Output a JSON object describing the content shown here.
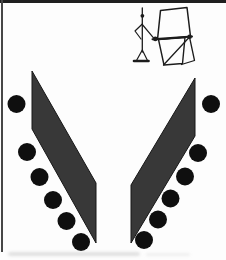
{
  "figure": {
    "kind": "scanned-book-diagram",
    "icon_name": "person-tilting-board-on-stand-icon"
  },
  "canvas": {
    "width": 226,
    "height": 260,
    "background": "#fdfdfd"
  },
  "colors": {
    "top_border": "#1f1f1f",
    "left_border": "#474747",
    "panel_fill": "#383838",
    "panel_stroke": "#161616",
    "dot_fill": "#0f0f0f",
    "icon_stroke": "#1c1c1c",
    "smudge": "#c4c4c4"
  },
  "shapes": {
    "left_panel": {
      "points": "32,71 96,183 96,243 32,129"
    },
    "right_panel": {
      "points": "195,78 195,136 131,243 131,185"
    },
    "dot_radius": 9,
    "left_dots": [
      [
        16.5,
        104
      ],
      [
        27,
        152
      ],
      [
        39.5,
        177
      ],
      [
        53,
        200
      ],
      [
        66.5,
        221
      ],
      [
        81,
        242
      ]
    ],
    "right_dots": [
      [
        211,
        104
      ],
      [
        198,
        153
      ],
      [
        185,
        176.5
      ],
      [
        170.5,
        198.5
      ],
      [
        158,
        219.5
      ],
      [
        144,
        240
      ]
    ]
  },
  "icon": {
    "paths": [
      {
        "part": "figure-body-and-antenna",
        "d": "M142.3 8 L142.3 52",
        "w": 1.3
      },
      {
        "part": "figure-left-arm-akimbo",
        "d": "M142.3 24 L135 31 L141 39",
        "w": 1.2
      },
      {
        "part": "figure-right-arm-to-board",
        "d": "M142.3 24.5 L153.5 37.8",
        "w": 1.2
      },
      {
        "part": "figure-base-legs",
        "d": "M142.3 50 L136.5 60.5 M142.3 50 L147.5 60.5",
        "w": 1.2
      },
      {
        "part": "figure-base-bar",
        "d": "M134 61 L148.5 61",
        "w": 2.6
      },
      {
        "part": "board-upper-panel",
        "d": "M160.5 10.5 L187 7.5 L190.5 36.5 L157.5 39.5 Z",
        "w": 1.5
      },
      {
        "part": "board-pivot-bar",
        "d": "M152.5 39.3 L192 36.6",
        "w": 2
      },
      {
        "part": "board-lower-panel",
        "d": "M158.5 39.5 L185 37.5 L182.5 63.5 L164 65 Z",
        "w": 1.4
      },
      {
        "part": "board-support-legs",
        "d": "M189.5 37 L163.5 65 M189.5 37 L194.5 60.5 L181.5 64.5",
        "w": 1.3
      }
    ],
    "knobs": [
      {
        "part": "figure-head",
        "cx": 142.4,
        "cy": 15.8,
        "r": 1.9
      },
      {
        "part": "board-left-pivot",
        "cx": 155.3,
        "cy": 38.9,
        "r": 2.3
      },
      {
        "part": "board-right-pivot",
        "cx": 189.6,
        "cy": 36.8,
        "r": 2.3
      }
    ]
  }
}
